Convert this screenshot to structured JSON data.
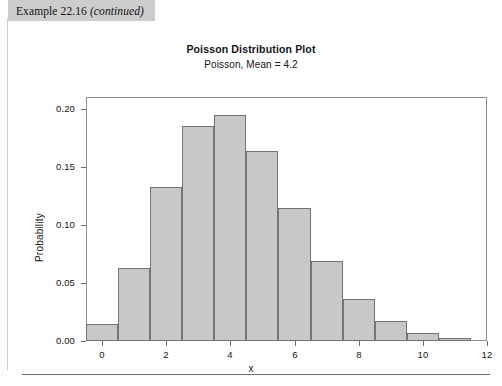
{
  "page": {
    "example_banner": {
      "label": "Example 22.16",
      "continued": "(continued)"
    }
  },
  "chart_data": {
    "type": "bar",
    "title": "Poisson Distribution Plot",
    "subtitle": "Poisson, Mean = 4.2",
    "xlabel": "x",
    "ylabel": "Probability",
    "categories": [
      0,
      1,
      2,
      3,
      4,
      5,
      6,
      7,
      8,
      9,
      10,
      11
    ],
    "values": [
      0.015,
      0.063,
      0.1323,
      0.1852,
      0.1944,
      0.1633,
      0.1143,
      0.0686,
      0.036,
      0.0168,
      0.0071,
      0.0027
    ],
    "x_ticks": [
      0,
      2,
      4,
      6,
      8,
      10,
      12
    ],
    "x_tick_labels": [
      "0",
      "2",
      "4",
      "6",
      "8",
      "10",
      "12"
    ],
    "y_ticks": [
      0.0,
      0.05,
      0.1,
      0.15,
      0.2
    ],
    "y_tick_labels": [
      "0.00",
      "0.05",
      "0.10",
      "0.15",
      "0.20"
    ],
    "xlim": [
      -0.5,
      12.0
    ],
    "ylim": [
      0.0,
      0.21
    ],
    "grid": false,
    "legend": false,
    "bar_color": "#c8c8c8",
    "bar_edge_color": "#737373",
    "frame_color": "#8f8f8f"
  }
}
